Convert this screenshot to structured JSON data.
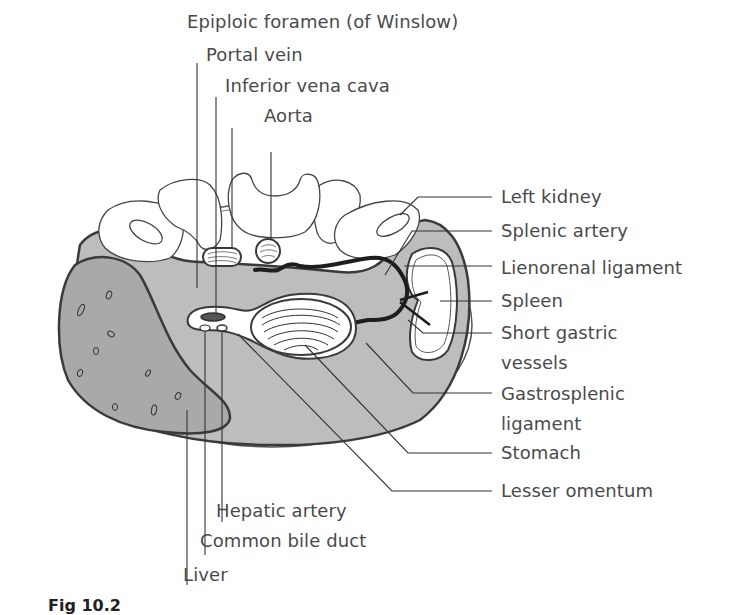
{
  "figure": {
    "caption": "Fig 10.2",
    "colors": {
      "peritoneal_cavity": "#bdbdbd",
      "liver": "#a9a9a9",
      "outline": "#3a3a3a",
      "vessel": "#1e1e1e",
      "background": "#ffffff",
      "text": "#4a4a4a"
    }
  },
  "labels": {
    "top": [
      {
        "id": "epiploic_foramen",
        "text": "Epiploic foramen (of Winslow)"
      },
      {
        "id": "portal_vein",
        "text": "Portal vein"
      },
      {
        "id": "inferior_vena_cava",
        "text": "Inferior vena cava"
      },
      {
        "id": "aorta",
        "text": "Aorta"
      }
    ],
    "right": [
      {
        "id": "left_kidney",
        "text": "Left kidney"
      },
      {
        "id": "splenic_artery",
        "text": "Splenic artery"
      },
      {
        "id": "lienorenal_ligament",
        "text": "Lienorenal ligament"
      },
      {
        "id": "spleen",
        "text": "Spleen"
      },
      {
        "id": "short_gastric_vessels_1",
        "text": "Short gastric"
      },
      {
        "id": "short_gastric_vessels_2",
        "text": "vessels"
      },
      {
        "id": "gastrosplenic_ligament_1",
        "text": "Gastrosplenic"
      },
      {
        "id": "gastrosplenic_ligament_2",
        "text": "ligament"
      },
      {
        "id": "stomach",
        "text": "Stomach"
      },
      {
        "id": "lesser_omentum",
        "text": "Lesser omentum"
      }
    ],
    "bottom": [
      {
        "id": "hepatic_artery",
        "text": "Hepatic artery"
      },
      {
        "id": "common_bile_duct",
        "text": "Common bile duct"
      },
      {
        "id": "liver",
        "text": "Liver"
      }
    ]
  }
}
